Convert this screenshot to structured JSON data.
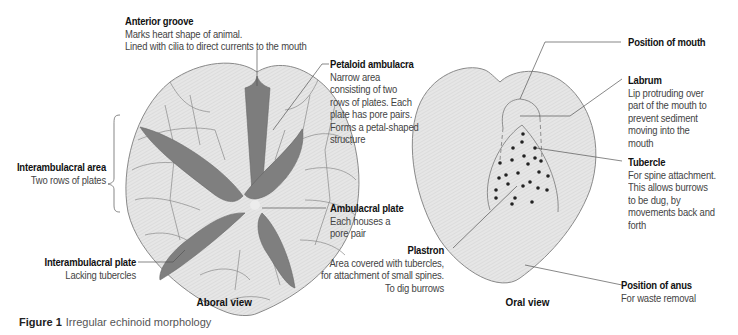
{
  "figure": {
    "number": "Figure 1",
    "title": "Irregular echinoid morphology"
  },
  "aboral_view": {
    "title": "Aboral view",
    "labels": [
      {
        "id": "anterior-groove",
        "title": "Anterior groove",
        "desc": "Marks heart shape of animal.\nLined with cilia to direct currents to the mouth"
      },
      {
        "id": "petaloid-ambulacra",
        "title": "Petaloid ambulacra",
        "desc": "Narrow area\nconsisting of two\nrows of plates. Each\nplate has pore pairs.\nForms a petal-shaped\nstructure"
      },
      {
        "id": "interambulacral-area",
        "title": "Interambulacral area",
        "desc": "Two rows of plates"
      },
      {
        "id": "ambulacral-plate",
        "title": "Ambulacral plate",
        "desc": "Each houses a\npore pair"
      },
      {
        "id": "interambulacral-plate",
        "title": "Interambulacral plate",
        "desc": "Lacking tubercles"
      }
    ]
  },
  "oral_view": {
    "title": "Oral view",
    "labels": [
      {
        "id": "position-of-mouth",
        "title": "Position of mouth",
        "desc": ""
      },
      {
        "id": "labrum",
        "title": "Labrum",
        "desc": "Lip protruding over\npart of the mouth to\nprevent sediment\nmoving into the\nmouth"
      },
      {
        "id": "tubercle",
        "title": "Tubercle",
        "desc": "For spine attachment.\nThis allows burrows\nto be dug, by\nmovements back and\nforth"
      },
      {
        "id": "plastron",
        "title": "Plastron",
        "desc": "Area covered with tubercles,\nfor attachment of small spines.\nTo dig burrows"
      },
      {
        "id": "position-of-anus",
        "title": "Position of anus",
        "desc": "For waste removal"
      }
    ]
  },
  "colors": {
    "body_fill": "#e4e4e4",
    "petal_fill": "#808080",
    "outline": "#7a7a7a",
    "leader_line": "#555555"
  }
}
